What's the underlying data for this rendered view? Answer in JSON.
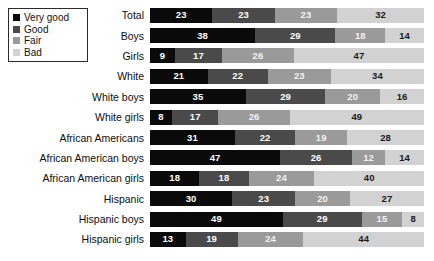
{
  "legend": {
    "items": [
      {
        "label": "Very good",
        "color": "#0a0a0a"
      },
      {
        "label": "Good",
        "color": "#4a4a4a"
      },
      {
        "label": "Fair",
        "color": "#9a9a9a"
      },
      {
        "label": "Bad",
        "color": "#d2d2d2"
      }
    ]
  },
  "chart_data": {
    "type": "bar",
    "orientation": "horizontal",
    "stacked": true,
    "title": "",
    "xlabel": "",
    "ylabel": "",
    "xlim": [
      0,
      100
    ],
    "grid": false,
    "legend_position": "top-left",
    "categories": [
      "Total",
      "Boys",
      "Girls",
      "White",
      "White boys",
      "White girls",
      "African Americans",
      "African American boys",
      "African American girls",
      "Hispanic",
      "Hispanic boys",
      "Hispanic girls"
    ],
    "series": [
      {
        "name": "Very good",
        "color": "#0a0a0a",
        "values": [
          23,
          38,
          9,
          21,
          35,
          8,
          31,
          47,
          18,
          30,
          49,
          13
        ]
      },
      {
        "name": "Good",
        "color": "#4a4a4a",
        "values": [
          23,
          29,
          17,
          22,
          29,
          17,
          22,
          26,
          18,
          23,
          29,
          19
        ]
      },
      {
        "name": "Fair",
        "color": "#9a9a9a",
        "values": [
          23,
          18,
          26,
          23,
          20,
          26,
          19,
          12,
          24,
          20,
          15,
          24
        ]
      },
      {
        "name": "Bad",
        "color": "#d2d2d2",
        "values": [
          32,
          14,
          47,
          34,
          16,
          49,
          28,
          14,
          40,
          27,
          8,
          44
        ]
      }
    ]
  }
}
